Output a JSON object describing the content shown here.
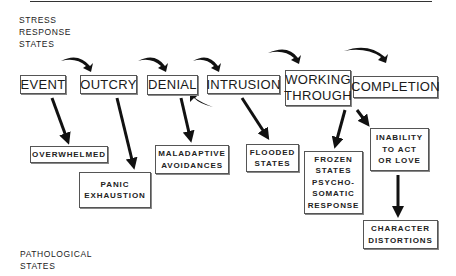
{
  "labels": {
    "stress": [
      "STRESS",
      "RESPONSE",
      "STATES"
    ],
    "pathological": [
      "PATHOLOGICAL",
      "STATES"
    ]
  },
  "stress_states": [
    {
      "id": "event",
      "lines": [
        "EVENT"
      ]
    },
    {
      "id": "outcry",
      "lines": [
        "OUTCRY"
      ]
    },
    {
      "id": "denial",
      "lines": [
        "DENIAL"
      ]
    },
    {
      "id": "intrusion",
      "lines": [
        "INTRUSION"
      ]
    },
    {
      "id": "working-through",
      "lines": [
        "WORKING",
        "THROUGH"
      ]
    },
    {
      "id": "completion",
      "lines": [
        "COMPLETION"
      ]
    }
  ],
  "pathological_states": [
    {
      "id": "overwhelmed",
      "lines": [
        "OVERWHELMED"
      ]
    },
    {
      "id": "panic-exhaustion",
      "lines": [
        "PANIC",
        "EXHAUSTION"
      ]
    },
    {
      "id": "maladaptive-avoidances",
      "lines": [
        "MALADAPTIVE",
        "AVOIDANCES"
      ]
    },
    {
      "id": "flooded-states",
      "lines": [
        "FLOODED",
        "STATES"
      ]
    },
    {
      "id": "frozen-states",
      "lines": [
        "FROZEN",
        "STATES",
        "PSYCHO-",
        "SOMATIC",
        "RESPONSE"
      ]
    },
    {
      "id": "inability",
      "lines": [
        "INABILITY",
        "TO ACT",
        "OR LOVE"
      ]
    },
    {
      "id": "character-distortions",
      "lines": [
        "CHARACTER",
        "DISTORTIONS"
      ]
    }
  ],
  "colors": {
    "ink": "#1a1a1a",
    "border": "#555555",
    "background": "#ffffff"
  }
}
